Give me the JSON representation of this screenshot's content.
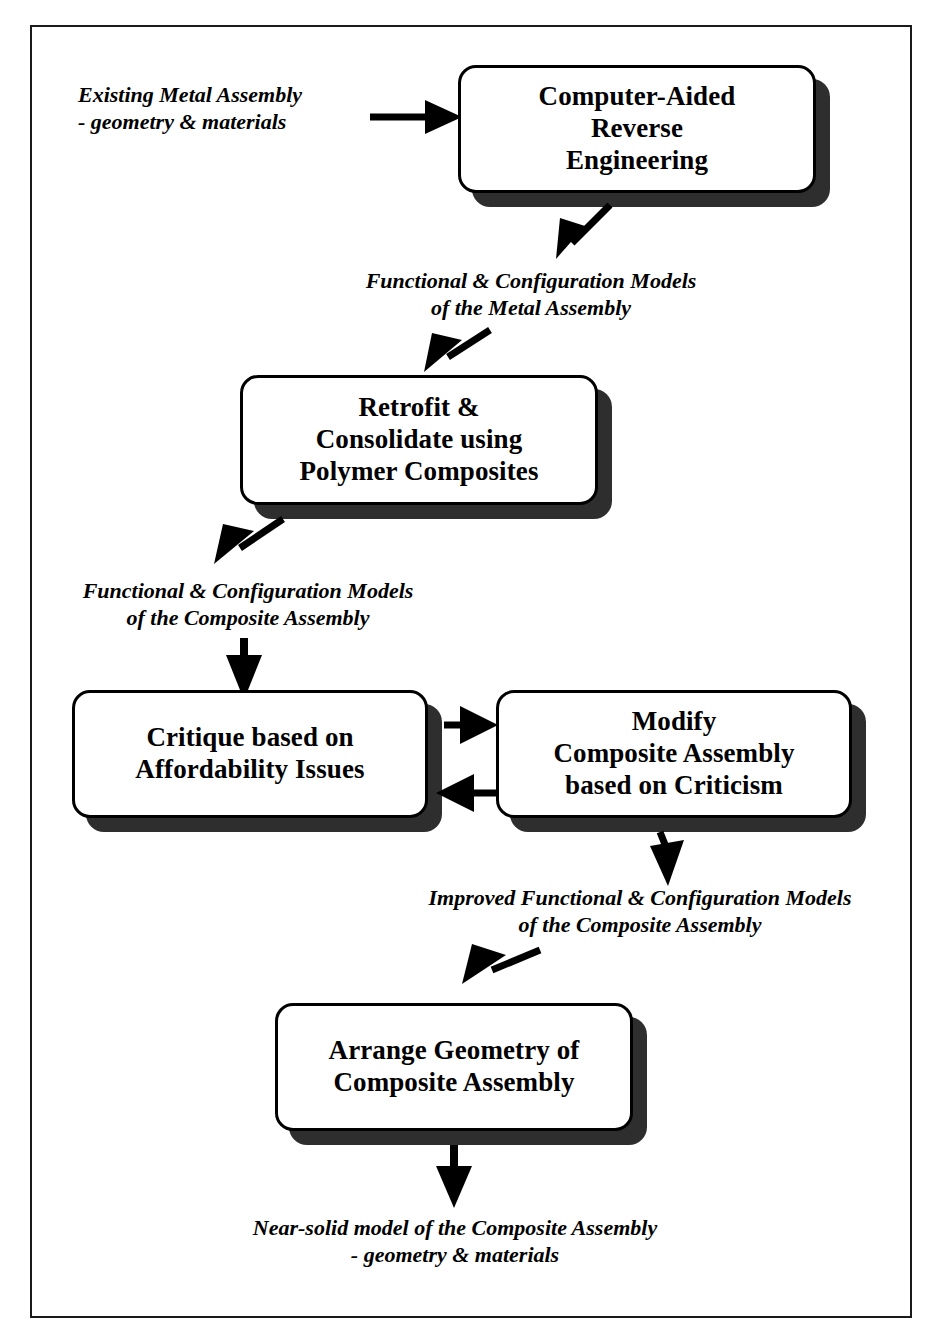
{
  "diagram": {
    "colors": {
      "ink": "#000000",
      "shadow": "#2e2e2e",
      "frame": "#1a1a1a",
      "background": "#ffffff"
    }
  },
  "nodes": [
    {
      "id": "computer-aided-reverse-engineering",
      "lines": [
        "Computer-Aided",
        "Reverse",
        "Engineering"
      ]
    },
    {
      "id": "retrofit-consolidate",
      "lines": [
        "Retrofit &",
        "Consolidate using",
        "Polymer Composites"
      ]
    },
    {
      "id": "critique-affordability",
      "lines": [
        "Critique based on",
        "Affordability Issues"
      ]
    },
    {
      "id": "modify-composite-assembly",
      "lines": [
        "Modify",
        "Composite Assembly",
        "based on Criticism"
      ]
    },
    {
      "id": "arrange-geometry",
      "lines": [
        "Arrange Geometry of",
        "Composite Assembly"
      ]
    }
  ],
  "notes": [
    {
      "id": "input-metal-assembly",
      "lines": [
        "Existing Metal Assembly",
        "- geometry & materials"
      ]
    },
    {
      "id": "metal-assembly-models",
      "lines": [
        "Functional & Configuration Models",
        "of  the Metal Assembly"
      ]
    },
    {
      "id": "composite-assembly-models",
      "lines": [
        "Functional & Configuration Models",
        "of the Composite Assembly"
      ]
    },
    {
      "id": "improved-composite-models",
      "lines": [
        "Improved Functional & Configuration Models",
        "of the Composite Assembly"
      ]
    },
    {
      "id": "near-solid-model-output",
      "lines": [
        "Near-solid model of the Composite Assembly",
        "- geometry & materials"
      ]
    }
  ],
  "arrows": [
    {
      "id": "input-to-care",
      "direction": "right"
    },
    {
      "id": "care-to-metal-models",
      "direction": "down-left"
    },
    {
      "id": "metal-models-to-retrofit",
      "direction": "down-left"
    },
    {
      "id": "retrofit-to-composite-models",
      "direction": "down-left"
    },
    {
      "id": "composite-models-to-critique",
      "direction": "down"
    },
    {
      "id": "critique-to-modify",
      "direction": "right"
    },
    {
      "id": "modify-to-critique",
      "direction": "left"
    },
    {
      "id": "modify-to-improved-models",
      "direction": "down"
    },
    {
      "id": "improved-models-to-arrange",
      "direction": "down-left"
    },
    {
      "id": "arrange-to-output",
      "direction": "down"
    }
  ]
}
